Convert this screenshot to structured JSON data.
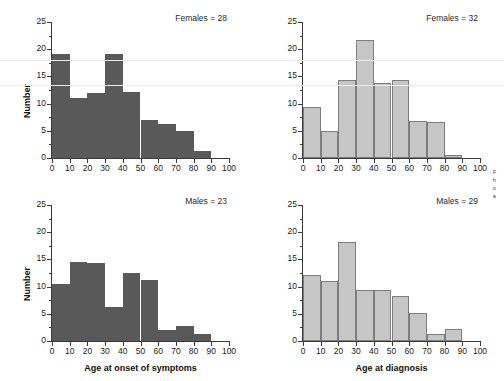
{
  "figure": {
    "y_axis_title": "Number",
    "x_axis_titles": {
      "left": "Age at onset of symptoms",
      "right": "Age at diagnosis"
    },
    "y_ticks": [
      "0",
      "5",
      "10",
      "15",
      "20",
      "25"
    ],
    "x_ticks": [
      "0",
      "10",
      "20",
      "30",
      "40",
      "50",
      "60",
      "70",
      "80",
      "90",
      "100"
    ],
    "colors": {
      "bar_dark": "#595959",
      "bar_light": "#c6c6c6",
      "bar_light_outline": "#7d7d7d",
      "axis": "#3a3a3a",
      "text": "#1a1a1a",
      "scanline": "#ececec"
    },
    "caption_fragments": [
      "F",
      "h",
      "o",
      "a"
    ]
  },
  "chart_data": [
    {
      "type": "bar",
      "panel": "top-left",
      "title": "Females = 28",
      "xlabel": "Age at onset of symptoms",
      "ylabel": "Number",
      "xlim": [
        0,
        100
      ],
      "ylim": [
        0,
        25
      ],
      "grid": false,
      "bin_width": 10,
      "categories": [
        "0-10",
        "10-20",
        "20-30",
        "30-40",
        "40-50",
        "50-60",
        "60-70",
        "70-80",
        "80-90",
        "90-100"
      ],
      "bin_starts": [
        0,
        10,
        20,
        30,
        40,
        50,
        60,
        70,
        80,
        90
      ],
      "values": [
        19.2,
        11.0,
        12.0,
        19.2,
        12.2,
        7.0,
        6.2,
        5.0,
        1.2,
        0.0
      ]
    },
    {
      "type": "bar",
      "panel": "top-right",
      "title": "Females = 32",
      "xlabel": "Age at diagnosis",
      "ylabel": "Number",
      "xlim": [
        0,
        100
      ],
      "ylim": [
        0,
        25
      ],
      "grid": false,
      "bin_width": 10,
      "categories": [
        "0-10",
        "10-20",
        "20-30",
        "30-40",
        "40-50",
        "50-60",
        "60-70",
        "70-80",
        "80-90",
        "90-100"
      ],
      "bin_starts": [
        0,
        10,
        20,
        30,
        40,
        50,
        60,
        70,
        80,
        90
      ],
      "values": [
        9.3,
        5.0,
        14.3,
        21.7,
        13.7,
        14.3,
        6.8,
        6.6,
        0.6,
        0.0
      ]
    },
    {
      "type": "bar",
      "panel": "bottom-left",
      "title": "Males = 23",
      "xlabel": "Age at onset of symptoms",
      "ylabel": "Number",
      "xlim": [
        0,
        100
      ],
      "ylim": [
        0,
        25
      ],
      "grid": false,
      "bin_width": 10,
      "categories": [
        "0-10",
        "10-20",
        "20-30",
        "30-40",
        "40-50",
        "50-60",
        "60-70",
        "70-80",
        "80-90",
        "90-100"
      ],
      "bin_starts": [
        0,
        10,
        20,
        30,
        40,
        50,
        60,
        70,
        80,
        90
      ],
      "values": [
        10.5,
        14.5,
        14.4,
        6.3,
        12.5,
        11.2,
        2.0,
        2.8,
        1.2,
        0.0
      ]
    },
    {
      "type": "bar",
      "panel": "bottom-right",
      "title": "Males = 29",
      "xlabel": "Age at diagnosis",
      "ylabel": "Number",
      "xlim": [
        0,
        100
      ],
      "ylim": [
        0,
        25
      ],
      "grid": false,
      "bin_width": 10,
      "categories": [
        "0-10",
        "10-20",
        "20-30",
        "30-40",
        "40-50",
        "50-60",
        "60-70",
        "70-80",
        "80-90",
        "90-100"
      ],
      "bin_starts": [
        0,
        10,
        20,
        30,
        40,
        50,
        60,
        70,
        80,
        90
      ],
      "values": [
        12.2,
        11.0,
        18.2,
        9.3,
        9.4,
        8.3,
        5.2,
        1.3,
        2.2,
        0.0
      ]
    }
  ]
}
